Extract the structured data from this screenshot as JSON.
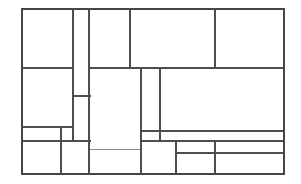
{
  "figure": {
    "canvas": {
      "width": 301,
      "height": 184
    },
    "background_color": "#ffffff",
    "line_color": "#4d4d4d",
    "outer_line_color": "#454545",
    "faint_line_color": "#8d8d8d",
    "line_width": 1.15,
    "outer_line_width": 1.35,
    "labels": [],
    "annotations": []
  },
  "bounds": {
    "left": 22,
    "top": 9,
    "right": 284,
    "bottom": 174,
    "width": 262,
    "height": 165
  },
  "cells": [
    {
      "id": "cell-1",
      "name": "top-left-large",
      "x": 22,
      "y": 9,
      "w": 51,
      "h": 59
    },
    {
      "id": "cell-2",
      "name": "top-narrow-column",
      "x": 73,
      "y": 9,
      "w": 16,
      "h": 87
    },
    {
      "id": "cell-3",
      "name": "top-center-left",
      "x": 89,
      "y": 9,
      "w": 41,
      "h": 59
    },
    {
      "id": "cell-4",
      "name": "top-center-wide",
      "x": 130,
      "y": 9,
      "w": 85,
      "h": 59
    },
    {
      "id": "cell-5",
      "name": "top-right",
      "x": 215,
      "y": 9,
      "w": 69,
      "h": 59
    },
    {
      "id": "cell-6",
      "name": "mid-left-upper",
      "x": 22,
      "y": 68,
      "w": 51,
      "h": 59
    },
    {
      "id": "cell-7",
      "name": "mid-narrow-lower",
      "x": 73,
      "y": 96,
      "w": 17,
      "h": 45
    },
    {
      "id": "cell-8",
      "name": "center-tall",
      "x": 89,
      "y": 68,
      "w": 52,
      "h": 81
    },
    {
      "id": "cell-9",
      "name": "center-narrow-tall",
      "x": 141,
      "y": 68,
      "w": 19,
      "h": 63
    },
    {
      "id": "cell-10",
      "name": "right-wide-mid",
      "x": 160,
      "y": 68,
      "w": 124,
      "h": 63
    },
    {
      "id": "cell-11",
      "name": "left-thin-strip",
      "x": 22,
      "y": 127,
      "w": 39,
      "h": 14
    },
    {
      "id": "cell-12",
      "name": "left-thin-strip-small",
      "x": 61,
      "y": 127,
      "w": 12,
      "h": 14
    },
    {
      "id": "cell-13",
      "name": "bottom-left",
      "x": 22,
      "y": 141,
      "w": 39,
      "h": 33
    },
    {
      "id": "cell-14",
      "name": "bottom-left-center",
      "x": 61,
      "y": 141,
      "w": 28,
      "h": 33
    },
    {
      "id": "cell-15",
      "name": "bottom-center",
      "x": 89,
      "y": 149,
      "w": 52,
      "h": 25
    },
    {
      "id": "cell-16",
      "name": "center-small-box",
      "x": 141,
      "y": 131,
      "w": 19,
      "h": 10
    },
    {
      "id": "cell-17",
      "name": "bottom-center-right",
      "x": 141,
      "y": 141,
      "w": 35,
      "h": 33
    },
    {
      "id": "cell-18",
      "name": "right-mid-strip",
      "x": 160,
      "y": 131,
      "w": 124,
      "h": 10
    },
    {
      "id": "cell-19",
      "name": "bottom-right-upper",
      "x": 176,
      "y": 141,
      "w": 39,
      "h": 12
    },
    {
      "id": "cell-20",
      "name": "bottom-right-lower",
      "x": 176,
      "y": 153,
      "w": 39,
      "h": 21
    },
    {
      "id": "cell-21",
      "name": "far-bottom-right-up",
      "x": 215,
      "y": 141,
      "w": 69,
      "h": 12
    },
    {
      "id": "cell-22",
      "name": "far-bottom-right-low",
      "x": 215,
      "y": 153,
      "w": 69,
      "h": 21
    }
  ],
  "segments": {
    "horizontal": [
      {
        "id": "h-top-border",
        "name": "outer-top-edge",
        "y": 9,
        "x1": 22,
        "x2": 284,
        "kind": "outer"
      },
      {
        "id": "h-68-left",
        "name": "divider-y68-left",
        "y": 68,
        "x1": 22,
        "x2": 73,
        "kind": "inner"
      },
      {
        "id": "h-68-right",
        "name": "divider-y68-right",
        "y": 68,
        "x1": 89,
        "x2": 284,
        "kind": "inner"
      },
      {
        "id": "h-96-narrow",
        "name": "divider-y96-narrow",
        "y": 96,
        "x1": 73,
        "x2": 90,
        "kind": "inner"
      },
      {
        "id": "h-127-left",
        "name": "divider-y127-left",
        "y": 127,
        "x1": 22,
        "x2": 73,
        "kind": "inner"
      },
      {
        "id": "h-131-center",
        "name": "divider-y131-center",
        "y": 131,
        "x1": 141,
        "x2": 284,
        "kind": "inner"
      },
      {
        "id": "h-141-left",
        "name": "divider-y141-left",
        "y": 141,
        "x1": 22,
        "x2": 90,
        "kind": "inner"
      },
      {
        "id": "h-141-right",
        "name": "divider-y141-right",
        "y": 141,
        "x1": 141,
        "x2": 284,
        "kind": "inner"
      },
      {
        "id": "h-149-center",
        "name": "divider-y149-center",
        "y": 149,
        "x1": 89,
        "x2": 141,
        "kind": "faint"
      },
      {
        "id": "h-153-right",
        "name": "divider-y153-right",
        "y": 153,
        "x1": 176,
        "x2": 284,
        "kind": "inner"
      },
      {
        "id": "h-bottom-border",
        "name": "outer-bottom-edge",
        "y": 174,
        "x1": 22,
        "x2": 284,
        "kind": "outer"
      }
    ],
    "vertical": [
      {
        "id": "v-left-border",
        "name": "outer-left-edge",
        "x": 22,
        "y1": 9,
        "y2": 174,
        "kind": "outer"
      },
      {
        "id": "v-61-bottom",
        "name": "divider-x61-bottom",
        "x": 61,
        "y1": 127,
        "y2": 174,
        "kind": "inner"
      },
      {
        "id": "v-73-top",
        "name": "divider-x73-top",
        "x": 73,
        "y1": 9,
        "y2": 141,
        "kind": "inner"
      },
      {
        "id": "v-89-top",
        "name": "divider-x89-top",
        "x": 89,
        "y1": 9,
        "y2": 174,
        "kind": "inner"
      },
      {
        "id": "v-130-top",
        "name": "divider-x130-top",
        "x": 130,
        "y1": 9,
        "y2": 68,
        "kind": "inner"
      },
      {
        "id": "v-141-mid",
        "name": "divider-x141-mid",
        "x": 141,
        "y1": 68,
        "y2": 174,
        "kind": "inner"
      },
      {
        "id": "v-160-mid",
        "name": "divider-x160-mid",
        "x": 160,
        "y1": 68,
        "y2": 141,
        "kind": "inner"
      },
      {
        "id": "v-176-bottom",
        "name": "divider-x176-bottom",
        "x": 176,
        "y1": 141,
        "y2": 174,
        "kind": "inner"
      },
      {
        "id": "v-215-top",
        "name": "divider-x215-top",
        "x": 215,
        "y1": 9,
        "y2": 68,
        "kind": "inner"
      },
      {
        "id": "v-215-bottom",
        "name": "divider-x215-bottom",
        "x": 215,
        "y1": 141,
        "y2": 174,
        "kind": "inner"
      },
      {
        "id": "v-right-border",
        "name": "outer-right-edge",
        "x": 284,
        "y1": 9,
        "y2": 174,
        "kind": "outer"
      }
    ]
  },
  "counts": {
    "cells": 22,
    "horizontal_segments": 11,
    "vertical_segments": 11
  }
}
